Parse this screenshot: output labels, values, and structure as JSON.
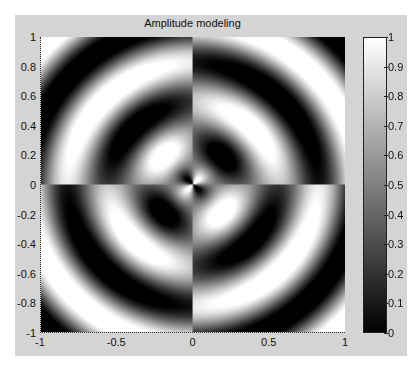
{
  "chart_data": {
    "type": "heatmap",
    "title": "Amplitude modeling",
    "xlabel": "",
    "ylabel": "",
    "xlim": [
      -1,
      1
    ],
    "ylim": [
      -1,
      1
    ],
    "x_ticks": [
      "-1",
      "-0.5",
      "0",
      "0.5",
      "1"
    ],
    "y_ticks": [
      "1",
      "0.8",
      "0.6",
      "0.4",
      "0.2",
      "0",
      "-0.2",
      "-0.4",
      "-0.6",
      "-0.8",
      "-1"
    ],
    "colormap": "gray",
    "colorbar": {
      "range": [
        0,
        1
      ],
      "ticks": [
        "1",
        "0.9",
        "0.8",
        "0.7",
        "0.6",
        "0.5",
        "0.4",
        "0.3",
        "0.2",
        "0.1",
        "0"
      ]
    },
    "model": {
      "description": "Concentric rings with angular sign modulation: I = 0.5 + 0.5*sin(2*theta)*cos(k*r), plus outer-ring contrast",
      "k": 11.5,
      "angular_order": 2,
      "outer_contrast_gain": 0.8
    },
    "grid": false,
    "legend": "none"
  }
}
